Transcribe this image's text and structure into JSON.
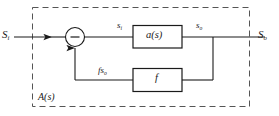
{
  "figure": {
    "type": "block-diagram",
    "background_color": "#ffffff",
    "line_color": "#1a1a1a",
    "dashed_color": "#555555"
  },
  "labels": {
    "input_signal": "S",
    "input_signal_sub": "i",
    "output_signal": "S",
    "output_signal_sub": "o",
    "error_signal": "s",
    "error_signal_sub": "i",
    "forward_output": "s",
    "forward_output_sub": "o",
    "feedback_signal": "fs",
    "feedback_signal_sub": "o",
    "forward_block": "a(s)",
    "feedback_block": "f",
    "system_block": "A(s)",
    "summing_sign": "−"
  },
  "elements": {
    "dashed_boundary_name": "A(s) system boundary",
    "summing_junction_name": "summing junction",
    "forward_block_name": "forward gain block a(s)",
    "feedback_block_name": "feedback network block f"
  }
}
